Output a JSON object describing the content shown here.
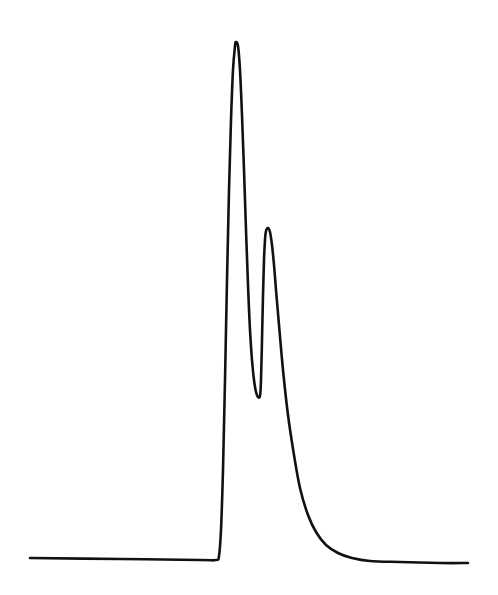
{
  "chart_data": {
    "type": "line",
    "title": "",
    "xlabel": "",
    "ylabel": "",
    "grid": false,
    "legend": null,
    "colors": {
      "line": "#111111",
      "background": "#ffffff"
    },
    "series": [
      {
        "name": "trace",
        "points_px": [
          [
            30,
            558
          ],
          [
            120,
            559
          ],
          [
            200,
            560
          ],
          [
            216,
            560
          ],
          [
            219,
            556
          ],
          [
            221,
            530
          ],
          [
            223,
            470
          ],
          [
            225,
            380
          ],
          [
            227,
            280
          ],
          [
            229,
            190
          ],
          [
            231,
            120
          ],
          [
            233,
            70
          ],
          [
            235,
            46
          ],
          [
            236,
            42
          ],
          [
            238,
            46
          ],
          [
            240,
            70
          ],
          [
            242,
            115
          ],
          [
            244,
            170
          ],
          [
            246,
            230
          ],
          [
            248,
            285
          ],
          [
            250,
            330
          ],
          [
            252,
            360
          ],
          [
            254,
            380
          ],
          [
            256,
            392
          ],
          [
            258,
            397
          ],
          [
            260,
            396
          ],
          [
            261,
            380
          ],
          [
            262,
            340
          ],
          [
            263,
            295
          ],
          [
            264,
            260
          ],
          [
            265,
            240
          ],
          [
            266,
            231
          ],
          [
            268,
            228
          ],
          [
            270,
            232
          ],
          [
            272,
            245
          ],
          [
            274,
            265
          ],
          [
            276,
            290
          ],
          [
            279,
            325
          ],
          [
            283,
            370
          ],
          [
            288,
            415
          ],
          [
            294,
            455
          ],
          [
            300,
            488
          ],
          [
            308,
            515
          ],
          [
            316,
            532
          ],
          [
            326,
            545
          ],
          [
            338,
            553
          ],
          [
            352,
            558
          ],
          [
            370,
            561
          ],
          [
            400,
            562
          ],
          [
            440,
            563
          ],
          [
            468,
            563
          ]
        ]
      }
    ],
    "peaks": [
      {
        "label": "peak-1",
        "x_px": 236,
        "y_px": 42
      },
      {
        "label": "peak-2",
        "x_px": 268,
        "y_px": 228
      }
    ],
    "valley": {
      "x_px": 260,
      "y_px": 396
    },
    "baseline_y_px": 560
  }
}
